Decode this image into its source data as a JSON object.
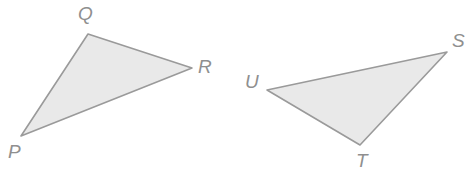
{
  "figure": {
    "background_color": "#ffffff",
    "width": 474,
    "height": 179
  },
  "style": {
    "fill_color": "#e9e9e9",
    "stroke_color": "#9a9a9a",
    "stroke_width": 1.6,
    "label_color": "#8f8f8f",
    "label_font_size": "19px"
  },
  "shapes": [
    {
      "name": "triangle-pqr",
      "label": "PQR",
      "fill": "#e9e9e9",
      "stroke": "#9a9a9a",
      "points": "21,136 88,34 192,68",
      "vertices": [
        {
          "id": "P",
          "label": "P",
          "x": 21,
          "y": 136,
          "label_x": 8,
          "label_y": 142
        },
        {
          "id": "Q",
          "label": "Q",
          "x": 88,
          "y": 34,
          "label_x": 78,
          "label_y": 4
        },
        {
          "id": "R",
          "label": "R",
          "x": 192,
          "y": 68,
          "label_x": 198,
          "label_y": 57
        }
      ]
    },
    {
      "name": "triangle-stu",
      "label": "STU",
      "fill": "#e9e9e9",
      "stroke": "#9a9a9a",
      "points": "447,52 360,145 267,90",
      "vertices": [
        {
          "id": "S",
          "label": "S",
          "x": 447,
          "y": 52,
          "label_x": 452,
          "label_y": 31
        },
        {
          "id": "T",
          "label": "T",
          "x": 360,
          "y": 145,
          "label_x": 356,
          "label_y": 151
        },
        {
          "id": "U",
          "label": "U",
          "x": 267,
          "y": 90,
          "label_x": 245,
          "label_y": 72
        }
      ]
    }
  ],
  "labels": {
    "p": "P",
    "q": "Q",
    "r": "R",
    "s": "S",
    "t": "T",
    "u": "U"
  }
}
